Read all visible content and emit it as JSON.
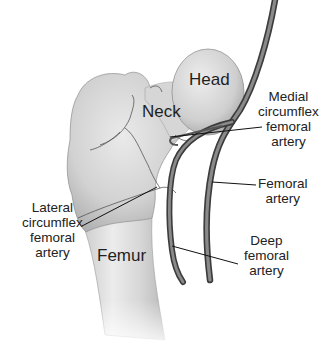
{
  "diagram": {
    "structures": {
      "head": "Head",
      "neck": "Neck",
      "femur": "Femur"
    },
    "callouts": {
      "medial_circumflex": [
        "Medial",
        "circumflex",
        "femoral",
        "artery"
      ],
      "femoral_artery": [
        "Femoral",
        "artery"
      ],
      "deep_femoral": [
        "Deep",
        "femoral",
        "artery"
      ],
      "lateral_circumflex": [
        "Lateral",
        "circumflex",
        "femoral",
        "artery"
      ]
    },
    "colors": {
      "bone_light": "#eeeeee",
      "bone_mid": "#c8c8c8",
      "bone_dark": "#8e8e8e",
      "artery": "#6a6a6a",
      "artery_edge": "#3a3a3a",
      "leader_line": "#111111",
      "text": "#222222"
    }
  }
}
